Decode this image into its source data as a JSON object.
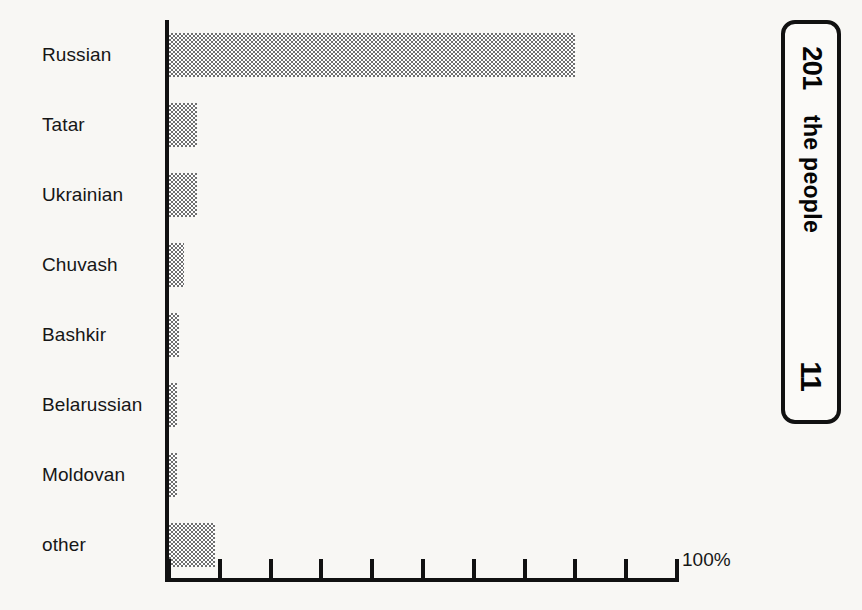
{
  "chart_data": {
    "type": "bar",
    "orientation": "horizontal",
    "title": "",
    "xlabel": "",
    "ylabel": "",
    "categories": [
      "Russian",
      "Tatar",
      "Ukrainian",
      "Chuvash",
      "Bashkir",
      "Belarussian",
      "Moldovan",
      "other"
    ],
    "values": [
      80,
      5.5,
      5.5,
      3,
      2,
      1.5,
      1.5,
      9
    ],
    "xlim": [
      0,
      100
    ],
    "units": "%",
    "axis_max_label": "100%",
    "tick_labels": [
      "",
      "",
      "",
      "",
      "",
      "",
      "",
      "",
      "",
      "",
      "100%"
    ],
    "tick_values": [
      0,
      10,
      20,
      30,
      40,
      50,
      60,
      70,
      80,
      90,
      100
    ],
    "grid": false,
    "legend": null,
    "bar_fill": "#808080",
    "bar_pattern": "50% checkerboard dither",
    "axis_color": "#111111"
  },
  "side_box": {
    "number_top": "201",
    "caption": "the people",
    "number_bottom": "11"
  },
  "colors": {
    "background": "#f8f7f4",
    "ink": "#161616",
    "bar_gray": "#6f6f6f"
  }
}
